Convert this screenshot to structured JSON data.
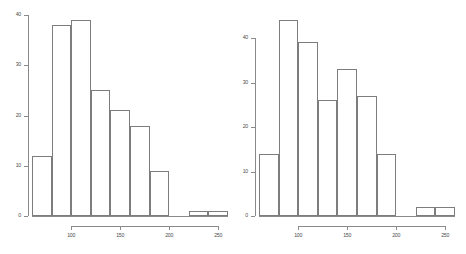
{
  "figure": {
    "type": "two-panel-histogram-figure",
    "background": "#ffffff",
    "bar_fill": "#ffffff",
    "bar_border": "#7d7d7d",
    "axis_color": "#8a8a8a"
  },
  "chart_data": [
    {
      "type": "bar",
      "panel": "left",
      "title": "",
      "xlabel": "",
      "ylabel": "",
      "grid": false,
      "legend": null,
      "xlim": [
        60,
        260
      ],
      "ylim": [
        0,
        40
      ],
      "ytick_labels": [
        "0",
        "10",
        "20",
        "30",
        "40"
      ],
      "ytick_values": [
        0,
        10,
        20,
        30,
        40
      ],
      "xtick_labels": [
        "100",
        "150",
        "200",
        "250"
      ],
      "xtick_values": [
        100,
        150,
        200,
        250
      ],
      "bin_width": 20,
      "bin_edges": [
        60,
        80,
        100,
        120,
        140,
        160,
        180,
        200,
        220,
        240,
        260
      ],
      "categories": [
        "60-80",
        "80-100",
        "100-120",
        "120-140",
        "140-160",
        "160-180",
        "180-200",
        "200-220",
        "220-240",
        "240-260"
      ],
      "values": [
        12,
        38,
        39,
        25,
        21,
        18,
        9,
        0,
        1,
        1
      ]
    },
    {
      "type": "bar",
      "panel": "right",
      "title": "",
      "xlabel": "",
      "ylabel": "",
      "grid": false,
      "legend": null,
      "xlim": [
        60,
        260
      ],
      "ylim": [
        0,
        40
      ],
      "ytick_labels": [
        "0",
        "10",
        "20",
        "30",
        "40"
      ],
      "ytick_values": [
        0,
        10,
        20,
        30,
        40
      ],
      "xtick_labels": [
        "100",
        "150",
        "200",
        "250"
      ],
      "xtick_values": [
        100,
        150,
        200,
        250
      ],
      "bin_width": 20,
      "bin_edges": [
        60,
        80,
        100,
        120,
        140,
        160,
        180,
        200,
        220,
        240,
        260
      ],
      "categories": [
        "60-80",
        "80-100",
        "100-120",
        "120-140",
        "140-160",
        "160-180",
        "180-200",
        "200-220",
        "220-240",
        "240-260"
      ],
      "values": [
        14,
        44,
        39,
        26,
        33,
        27,
        14,
        0,
        2,
        2
      ]
    }
  ]
}
